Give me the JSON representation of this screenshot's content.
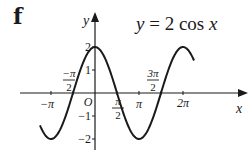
{
  "figure": {
    "part_label": "f",
    "equation": {
      "var_y": "y",
      "eq": " = 2 cos ",
      "var_x": "x"
    },
    "axis_labels": {
      "x": "x",
      "y": "y",
      "origin": "O"
    },
    "x_ticks": [
      {
        "label": "−π",
        "value": -3.14159
      },
      {
        "label_num": "−π",
        "label_den": "2",
        "value": -1.5708
      },
      {
        "label_num": "π",
        "label_den": "2",
        "value": 1.5708
      },
      {
        "label": "π",
        "value": 3.14159
      },
      {
        "label_num": "3π",
        "label_den": "2",
        "value": 4.7124
      },
      {
        "label": "2π",
        "value": 6.28319
      }
    ],
    "y_ticks": [
      "2",
      "1",
      "−1",
      "−2"
    ]
  },
  "chart_data": {
    "type": "line",
    "title": "y = 2 cos x",
    "panel_label": "f",
    "xlabel": "x",
    "ylabel": "y",
    "function": "2*cos(x)",
    "xlim": [
      -4.0,
      7.1
    ],
    "ylim": [
      -2.3,
      2.7
    ],
    "x_tick_labels": [
      "−π",
      "−π/2",
      "π/2",
      "π",
      "3π/2",
      "2π"
    ],
    "y_tick_labels": [
      "2",
      "1",
      "−1",
      "−2"
    ],
    "grid": false,
    "legend": null,
    "series": [
      {
        "name": "y = 2 cos x",
        "x": [
          -3.93,
          -3.14159,
          -2.356,
          -1.5708,
          -0.785,
          0,
          0.785,
          1.5708,
          2.356,
          3.14159,
          3.927,
          4.7124,
          5.498,
          6.28319,
          7.07
        ],
        "values": [
          -1.41,
          -2,
          -1.41,
          0,
          1.41,
          2,
          1.41,
          0,
          -1.41,
          -2,
          -1.41,
          0,
          1.41,
          2,
          1.41
        ]
      }
    ],
    "annotations": [
      "O"
    ]
  }
}
